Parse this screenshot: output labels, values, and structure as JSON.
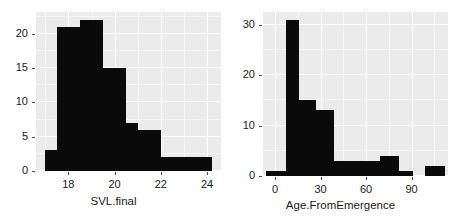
{
  "figure": {
    "background_color": "#ffffff",
    "panel_background_color": "#ebebeb",
    "bar_color": "#0a0a0a",
    "grid_color": "#ffffff"
  },
  "chart_data": [
    {
      "type": "bar",
      "subplot": "left",
      "title": "",
      "xlabel": "SVL.final",
      "ylabel": "",
      "xlim": [
        16.6,
        24.6
      ],
      "ylim": [
        0,
        23.2
      ],
      "xticks": [
        18,
        20,
        22,
        24
      ],
      "xtick_labels": [
        "18",
        "20",
        "22",
        "24"
      ],
      "yticks": [
        0,
        5,
        10,
        15,
        20
      ],
      "ytick_labels": [
        "0",
        "5",
        "10",
        "15",
        "20"
      ],
      "grid": true,
      "legend": null,
      "bin_width": 0.5,
      "bins": [
        {
          "x0": 17.0,
          "x1": 17.5,
          "count": 3
        },
        {
          "x0": 17.5,
          "x1": 18.5,
          "count": 21
        },
        {
          "x0": 18.5,
          "x1": 19.5,
          "count": 22
        },
        {
          "x0": 19.5,
          "x1": 20.5,
          "count": 15
        },
        {
          "x0": 20.5,
          "x1": 21.0,
          "count": 7
        },
        {
          "x0": 21.0,
          "x1": 22.0,
          "count": 6
        },
        {
          "x0": 22.0,
          "x1": 24.2,
          "count": 2
        }
      ],
      "categories": [
        "17.0-17.5",
        "17.5-18.5",
        "18.5-19.5",
        "19.5-20.5",
        "20.5-21.0",
        "21.0-22.0",
        "22.0-24.2"
      ],
      "values": [
        3,
        21,
        22,
        15,
        7,
        6,
        2
      ]
    },
    {
      "type": "bar",
      "subplot": "right",
      "title": "",
      "xlabel": "Age.FromEmergence",
      "ylabel": "",
      "xlim": [
        -8,
        114
      ],
      "ylim": [
        0,
        32.5
      ],
      "xticks": [
        0,
        30,
        60,
        90
      ],
      "xtick_labels": [
        "0",
        "30",
        "60",
        "90"
      ],
      "yticks": [
        0,
        10,
        20,
        30
      ],
      "ytick_labels": [
        "0",
        "10",
        "20",
        "30"
      ],
      "grid": true,
      "legend": null,
      "bin_width": 7.5,
      "bins": [
        {
          "x0": -6,
          "x1": 7,
          "count": 1
        },
        {
          "x0": 7,
          "x1": 16,
          "count": 31
        },
        {
          "x0": 16,
          "x1": 27,
          "count": 15
        },
        {
          "x0": 27,
          "x1": 39,
          "count": 13
        },
        {
          "x0": 39,
          "x1": 52,
          "count": 3
        },
        {
          "x0": 52,
          "x1": 69,
          "count": 3
        },
        {
          "x0": 69,
          "x1": 82,
          "count": 4
        },
        {
          "x0": 82,
          "x1": 91,
          "count": 1
        },
        {
          "x0": 91,
          "x1": 99,
          "count": 0
        },
        {
          "x0": 99,
          "x1": 112,
          "count": 2
        }
      ],
      "categories": [
        "-6-7",
        "7-16",
        "16-27",
        "27-39",
        "39-52",
        "52-69",
        "69-82",
        "82-91",
        "91-99",
        "99-112"
      ],
      "values": [
        1,
        31,
        15,
        13,
        3,
        3,
        4,
        1,
        0,
        2
      ]
    }
  ]
}
